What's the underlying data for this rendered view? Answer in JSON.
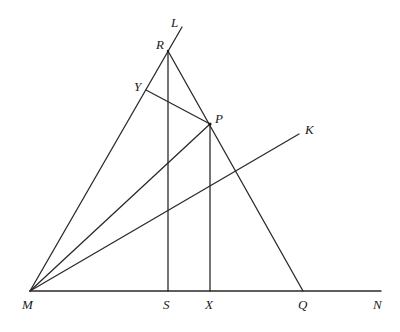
{
  "diagram": {
    "title": "",
    "points": {
      "M": {
        "label": "M",
        "x": 30,
        "y": 291,
        "lx": 22,
        "ly": 309
      },
      "S": {
        "label": "S",
        "x": 168,
        "y": 291,
        "lx": 163,
        "ly": 309
      },
      "X": {
        "label": "X",
        "x": 210,
        "y": 291,
        "lx": 205,
        "ly": 309
      },
      "Q": {
        "label": "Q",
        "x": 303,
        "y": 291,
        "lx": 298,
        "ly": 309
      },
      "N": {
        "label": "N",
        "x": 381,
        "y": 291,
        "lx": 373,
        "ly": 309
      },
      "R": {
        "label": "R",
        "x": 168,
        "y": 51,
        "lx": 156,
        "ly": 49
      },
      "L": {
        "label": "L",
        "x": 182,
        "y": 27,
        "lx": 171,
        "ly": 27
      },
      "Y": {
        "label": "Y",
        "x": 146,
        "y": 90,
        "lx": 134,
        "ly": 91
      },
      "P": {
        "label": "P",
        "x": 210,
        "y": 124,
        "lx": 215,
        "ly": 123
      },
      "K": {
        "label": "K",
        "x": 299,
        "y": 134,
        "lx": 305,
        "ly": 134
      }
    },
    "segments": [
      [
        "M",
        "N"
      ],
      [
        "M",
        "L"
      ],
      [
        "R",
        "Q"
      ],
      [
        "R",
        "S"
      ],
      [
        "P",
        "X"
      ],
      [
        "Y",
        "P"
      ],
      [
        "M",
        "P"
      ],
      [
        "M",
        "K"
      ]
    ]
  },
  "labels": {
    "M": "M",
    "S": "S",
    "X": "X",
    "Q": "Q",
    "N": "N",
    "R": "R",
    "L": "L",
    "Y": "Y",
    "P": "P",
    "K": "K"
  }
}
